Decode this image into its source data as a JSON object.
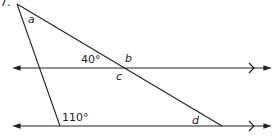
{
  "diagram": {
    "question_number": "7.",
    "labels": {
      "a": "a",
      "b": "b",
      "c": "c",
      "d": "d",
      "angle_top": "40°",
      "angle_bottom": "110°"
    },
    "colors": {
      "line": "#222222",
      "background": "#ffffff"
    },
    "geometry": {
      "top_vertex": [
        17,
        4
      ],
      "upper_line_y": 68,
      "lower_line_y": 126,
      "upper_intersection_x": 125,
      "lower_left_x": 60,
      "lower_right_x": 222
    }
  }
}
